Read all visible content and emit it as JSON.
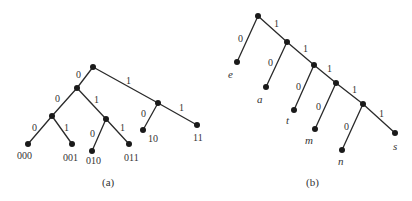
{
  "diagram_a": {
    "caption": "(a)",
    "nodes": [
      {
        "id": "root",
        "x": 93,
        "y": 67
      },
      {
        "id": "n0",
        "x": 77,
        "y": 88
      },
      {
        "id": "n1",
        "x": 158,
        "y": 103
      },
      {
        "id": "n00",
        "x": 52,
        "y": 116
      },
      {
        "id": "n01",
        "x": 106,
        "y": 119
      },
      {
        "id": "l000",
        "x": 28,
        "y": 144
      },
      {
        "id": "l001",
        "x": 72,
        "y": 144
      },
      {
        "id": "l010",
        "x": 92,
        "y": 151
      },
      {
        "id": "l011",
        "x": 129,
        "y": 144
      },
      {
        "id": "l10",
        "x": 143,
        "y": 130
      },
      {
        "id": "l11",
        "x": 197,
        "y": 125
      }
    ],
    "edges": [
      {
        "from": "root",
        "to": "n0",
        "label": "0"
      },
      {
        "from": "root",
        "to": "n1",
        "label": "1"
      },
      {
        "from": "n0",
        "to": "n00",
        "label": "0"
      },
      {
        "from": "n0",
        "to": "n01",
        "label": "1"
      },
      {
        "from": "n00",
        "to": "l000",
        "label": "0"
      },
      {
        "from": "n00",
        "to": "l001",
        "label": "1"
      },
      {
        "from": "n01",
        "to": "l010",
        "label": "0"
      },
      {
        "from": "n01",
        "to": "l011",
        "label": "1"
      },
      {
        "from": "n1",
        "to": "l10",
        "label": "0"
      },
      {
        "from": "n1",
        "to": "l11",
        "label": "1"
      }
    ],
    "edge_labels": [
      "0",
      "1",
      "0",
      "1",
      "0",
      "1",
      "0",
      "1",
      "0",
      "1"
    ],
    "leaf_labels": [
      "000",
      "001",
      "010",
      "011",
      "10",
      "11"
    ]
  },
  "diagram_b": {
    "caption": "(b)",
    "nodes": [
      {
        "id": "r",
        "x": 258,
        "y": 16
      },
      {
        "id": "b1",
        "x": 287,
        "y": 42
      },
      {
        "id": "b2",
        "x": 314,
        "y": 65
      },
      {
        "id": "b3",
        "x": 336,
        "y": 83
      },
      {
        "id": "b4",
        "x": 363,
        "y": 104
      },
      {
        "id": "e",
        "x": 237,
        "y": 62
      },
      {
        "id": "a",
        "x": 266,
        "y": 87
      },
      {
        "id": "t",
        "x": 294,
        "y": 110
      },
      {
        "id": "m",
        "x": 315,
        "y": 129
      },
      {
        "id": "n",
        "x": 342,
        "y": 150
      },
      {
        "id": "s",
        "x": 395,
        "y": 133
      }
    ],
    "edge_labels": [
      "0",
      "1",
      "0",
      "1",
      "0",
      "1",
      "0",
      "1",
      "0",
      "1"
    ],
    "leaf_labels": [
      "e",
      "a",
      "t",
      "m",
      "n",
      "s"
    ]
  }
}
